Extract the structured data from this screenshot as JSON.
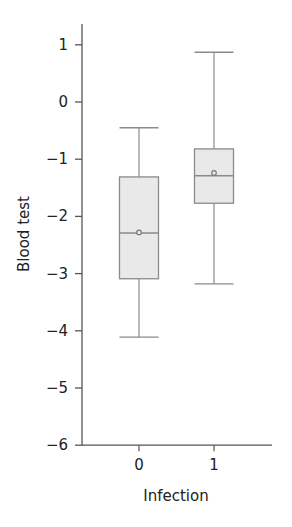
{
  "chart_data": {
    "type": "boxplot",
    "title": "",
    "xlabel": "Infection",
    "ylabel": "Blood test",
    "categories": [
      "0",
      "1"
    ],
    "ylim": [
      -6,
      1.35
    ],
    "yticks": [
      1,
      0,
      -1,
      -2,
      -3,
      -4,
      -5,
      -6
    ],
    "ytick_labels": [
      "1",
      "0",
      "−1",
      "−2",
      "−3",
      "−4",
      "−5",
      "−6"
    ],
    "grid": false,
    "legend": null,
    "series": [
      {
        "name": "0",
        "whisker_high": -0.45,
        "q3": -1.31,
        "median": -2.29,
        "mean": -2.28,
        "q1": -3.09,
        "whisker_low": -4.11
      },
      {
        "name": "1",
        "whisker_high": 0.87,
        "q3": -0.82,
        "median": -1.29,
        "mean": -1.24,
        "q1": -1.77,
        "whisker_low": -3.18
      }
    ],
    "colors": {
      "box_fill": "#e9e9e9",
      "box_stroke": "#8a8a8a",
      "axis": "#555555"
    }
  }
}
